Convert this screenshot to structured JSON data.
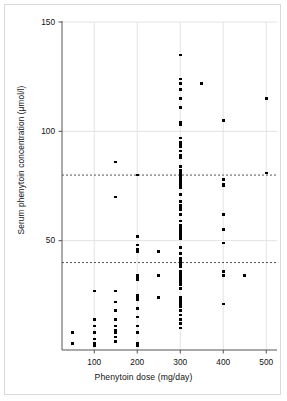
{
  "figure": {
    "frame_color": "#d9d9d9",
    "background": "#ffffff"
  },
  "chart_data": {
    "type": "scatter",
    "title": "",
    "xlabel": "Phenytoin dose (mg/day)",
    "ylabel": "Serum phenytoin concentration (μmol/l)",
    "xlim": [
      25,
      525
    ],
    "ylim": [
      0,
      150
    ],
    "xticks": [
      100,
      200,
      300,
      400,
      500
    ],
    "xtick_labels": [
      "100",
      "200",
      "300",
      "400",
      "500"
    ],
    "yticks": [
      50,
      100,
      150
    ],
    "ytick_labels": [
      "50",
      "100",
      "150"
    ],
    "grid": true,
    "grid_color": "#e3e3e3",
    "legend": "none",
    "marker": {
      "shape": "square",
      "color": "#000000",
      "size_px": 2.6
    },
    "reference_lines": [
      {
        "name": "therapeutic-range-lower",
        "axis": "y",
        "value": 40,
        "style": "dashed",
        "color": "#555555"
      },
      {
        "name": "therapeutic-range-upper",
        "axis": "y",
        "value": 80,
        "style": "dashed",
        "color": "#555555"
      }
    ],
    "points": [
      [
        50,
        8
      ],
      [
        50,
        3
      ],
      [
        100,
        27
      ],
      [
        100,
        14
      ],
      [
        100,
        11
      ],
      [
        100,
        8
      ],
      [
        100,
        5
      ],
      [
        100,
        3
      ],
      [
        100,
        3
      ],
      [
        100,
        3
      ],
      [
        100,
        3
      ],
      [
        100,
        2
      ],
      [
        150,
        86
      ],
      [
        150,
        70
      ],
      [
        150,
        27
      ],
      [
        150,
        22
      ],
      [
        150,
        18
      ],
      [
        150,
        14
      ],
      [
        150,
        11
      ],
      [
        150,
        9
      ],
      [
        150,
        8
      ],
      [
        150,
        6
      ],
      [
        150,
        4
      ],
      [
        200,
        80
      ],
      [
        200,
        52
      ],
      [
        200,
        48
      ],
      [
        200,
        46
      ],
      [
        200,
        45
      ],
      [
        200,
        34
      ],
      [
        200,
        33
      ],
      [
        200,
        32
      ],
      [
        200,
        25
      ],
      [
        200,
        24
      ],
      [
        200,
        24
      ],
      [
        200,
        23
      ],
      [
        200,
        23
      ],
      [
        200,
        19
      ],
      [
        200,
        15
      ],
      [
        200,
        11
      ],
      [
        200,
        8
      ],
      [
        200,
        3
      ],
      [
        200,
        2
      ],
      [
        250,
        45
      ],
      [
        250,
        34
      ],
      [
        250,
        24
      ],
      [
        300,
        135
      ],
      [
        300,
        124
      ],
      [
        300,
        122
      ],
      [
        300,
        119
      ],
      [
        300,
        115
      ],
      [
        300,
        111
      ],
      [
        300,
        104
      ],
      [
        300,
        103
      ],
      [
        300,
        97
      ],
      [
        300,
        95
      ],
      [
        300,
        94
      ],
      [
        300,
        93
      ],
      [
        300,
        91
      ],
      [
        300,
        89
      ],
      [
        300,
        88
      ],
      [
        300,
        84
      ],
      [
        300,
        82
      ],
      [
        300,
        81
      ],
      [
        300,
        80
      ],
      [
        300,
        80
      ],
      [
        300,
        79
      ],
      [
        300,
        78
      ],
      [
        300,
        77
      ],
      [
        300,
        77
      ],
      [
        300,
        76
      ],
      [
        300,
        76
      ],
      [
        300,
        75
      ],
      [
        300,
        75
      ],
      [
        300,
        74
      ],
      [
        300,
        71
      ],
      [
        300,
        68
      ],
      [
        300,
        66
      ],
      [
        300,
        65
      ],
      [
        300,
        64
      ],
      [
        300,
        62
      ],
      [
        300,
        59
      ],
      [
        300,
        57
      ],
      [
        300,
        56
      ],
      [
        300,
        55
      ],
      [
        300,
        54
      ],
      [
        300,
        53
      ],
      [
        300,
        52
      ],
      [
        300,
        51
      ],
      [
        300,
        47
      ],
      [
        300,
        44
      ],
      [
        300,
        42
      ],
      [
        300,
        41
      ],
      [
        300,
        40
      ],
      [
        300,
        40
      ],
      [
        300,
        39
      ],
      [
        300,
        38
      ],
      [
        300,
        36
      ],
      [
        300,
        35
      ],
      [
        300,
        35
      ],
      [
        300,
        34
      ],
      [
        300,
        34
      ],
      [
        300,
        34
      ],
      [
        300,
        33
      ],
      [
        300,
        33
      ],
      [
        300,
        32
      ],
      [
        300,
        31
      ],
      [
        300,
        30
      ],
      [
        300,
        28
      ],
      [
        300,
        24
      ],
      [
        300,
        23
      ],
      [
        300,
        23
      ],
      [
        300,
        22
      ],
      [
        300,
        22
      ],
      [
        300,
        21
      ],
      [
        300,
        20
      ],
      [
        300,
        18
      ],
      [
        300,
        16
      ],
      [
        300,
        14
      ],
      [
        300,
        12
      ],
      [
        300,
        10
      ],
      [
        350,
        122
      ],
      [
        400,
        105
      ],
      [
        400,
        78
      ],
      [
        400,
        76
      ],
      [
        400,
        75
      ],
      [
        400,
        62
      ],
      [
        400,
        55
      ],
      [
        400,
        49
      ],
      [
        400,
        36
      ],
      [
        400,
        34
      ],
      [
        400,
        21
      ],
      [
        450,
        34
      ],
      [
        500,
        115
      ],
      [
        500,
        81
      ]
    ]
  }
}
